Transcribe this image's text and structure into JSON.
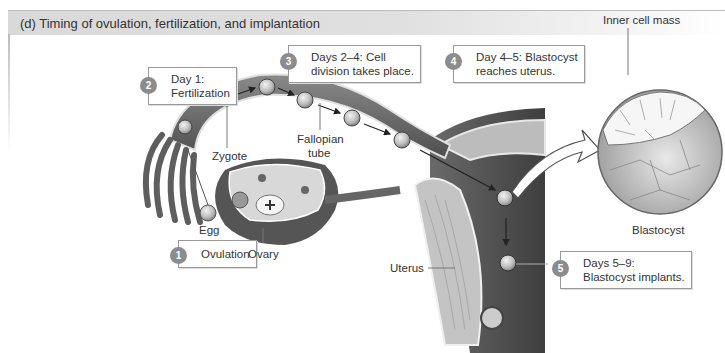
{
  "figure": {
    "title": "(d) Timing of ovulation, fertilization, and implantation"
  },
  "steps": [
    {
      "number": "1",
      "text_lines": [
        "Ovulation"
      ]
    },
    {
      "number": "2",
      "text_lines": [
        "Day 1:",
        "Fertilization"
      ]
    },
    {
      "number": "3",
      "text_lines": [
        "Days 2–4: Cell",
        "division takes place."
      ]
    },
    {
      "number": "4",
      "text_lines": [
        "Day 4–5: Blastocyst",
        "reaches uterus."
      ]
    },
    {
      "number": "5",
      "text_lines": [
        "Days 5–9:",
        "Blastocyst implants."
      ]
    }
  ],
  "labels": {
    "zygote": "Zygote",
    "fallopian_tube_1": "Fallopian",
    "fallopian_tube_2": "tube",
    "egg": "Egg",
    "ovary": "Ovary",
    "uterus": "Uterus",
    "inner_cell_mass": "Inner cell mass",
    "blastocyst": "Blastocyst"
  },
  "colors": {
    "step_badge": "#8c8c8c",
    "callout_border": "#9a9a9a",
    "tissue_dark": "#5a5a5a",
    "tissue_light": "#cfcfcf"
  }
}
